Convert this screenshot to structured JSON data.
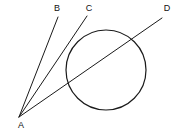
{
  "figure": {
    "background_color": "#ffffff",
    "stroke_color": "#1a1a1a",
    "label_color": "#111111",
    "width": 180,
    "height": 133,
    "points": {
      "A": {
        "label": "A",
        "x": 19,
        "y": 117,
        "label_x": 21,
        "label_y": 126,
        "role": "external-vertex"
      },
      "B": {
        "label": "B",
        "x": 58,
        "y": 17,
        "label_x": 57,
        "label_y": 9,
        "role": "ray-endpoint"
      },
      "C": {
        "label": "C",
        "x": 87,
        "y": 16,
        "label_x": 89,
        "label_y": 9,
        "role": "tangent-ray-endpoint"
      },
      "D": {
        "label": "D",
        "x": 162,
        "y": 18,
        "label_x": 167,
        "label_y": 9,
        "role": "secant-ray-endpoint"
      }
    },
    "circle": {
      "name": "main-circle",
      "cx": 106,
      "cy": 70,
      "r": 40
    },
    "segments": [
      {
        "name": "segment-ab",
        "from": "A",
        "to": "B",
        "kind": "ray"
      },
      {
        "name": "segment-ac",
        "from": "A",
        "to": "C",
        "kind": "tangent"
      },
      {
        "name": "segment-ad",
        "from": "A",
        "to": "D",
        "kind": "secant"
      }
    ],
    "labels": {
      "a": "A",
      "b": "B",
      "c": "C",
      "d": "D"
    }
  },
  "chart_data": {
    "type": "scatter",
    "xlabel": "",
    "ylabel": "",
    "xlim": [
      0,
      180
    ],
    "ylim": [
      0,
      133
    ],
    "grid": false,
    "legend": "none",
    "categories": [
      "A",
      "B",
      "C",
      "D"
    ],
    "x": [
      19,
      58,
      87,
      162
    ],
    "y": [
      117,
      17,
      16,
      18
    ],
    "annotations": [
      "A is the external point from which three rays emanate",
      "Ray AB passes left of the circle",
      "Ray AC is tangent to the circle near (74, 43)",
      "Ray AD is a secant crossing the circle near (72, 88) and (133, 45)",
      "Circle center (106, 70), radius 40"
    ]
  }
}
